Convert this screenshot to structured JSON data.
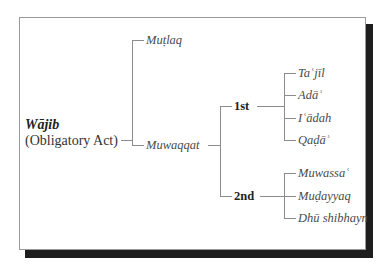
{
  "diagram": {
    "type": "tree",
    "root": {
      "title": "Wājib",
      "subtitle": "(Obligatory Act)"
    },
    "level1": [
      {
        "label": "Muṭlaq"
      },
      {
        "label": "Muwaqqat"
      }
    ],
    "level2": [
      {
        "label": "1st"
      },
      {
        "label": "2nd"
      }
    ],
    "first_group": [
      {
        "label": "Taʿjīl"
      },
      {
        "label": "Adāʾ"
      },
      {
        "label": "Iʿādah"
      },
      {
        "label": "Qaḍāʾ"
      }
    ],
    "second_group": [
      {
        "label": "Muwassaʿ"
      },
      {
        "label": "Muḍayyaq"
      },
      {
        "label": "Dhū shibhayn"
      }
    ],
    "colors": {
      "lines": "#8c8c8c",
      "frame_border": "#9a9a9a",
      "shadow": "#1e1e1e",
      "background": "#ffffff"
    }
  }
}
